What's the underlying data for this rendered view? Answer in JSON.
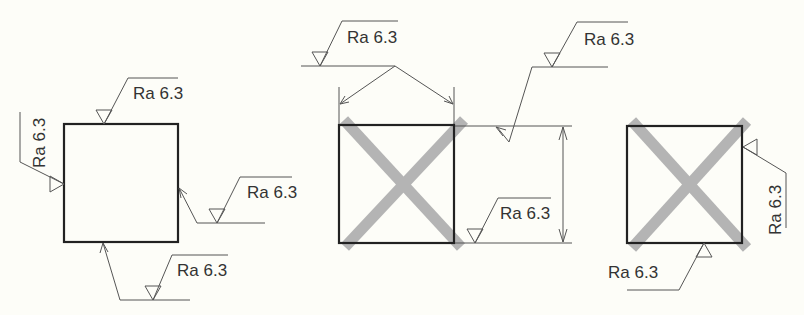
{
  "diagram": {
    "colors": {
      "background": "#fdfdf8",
      "outline": "#222222",
      "leader": "#555555",
      "cross_mark": "#b4b4b4",
      "text": "#333333"
    },
    "figures": [
      {
        "id": "figure-1",
        "type": "plain-square",
        "labels": {
          "top": "Ra 6.3",
          "left": "Ra 6.3",
          "right": "Ra 6.3",
          "bottom": "Ra 6.3"
        }
      },
      {
        "id": "figure-2",
        "type": "crossed-square",
        "labels": {
          "top_common": "Ra 6.3",
          "right_extension": "Ra 6.3",
          "right_dimension": "Ra 6.3"
        }
      },
      {
        "id": "figure-3",
        "type": "crossed-square",
        "labels": {
          "right": "Ra 6.3",
          "bottom": "Ra 6.3"
        }
      }
    ]
  }
}
